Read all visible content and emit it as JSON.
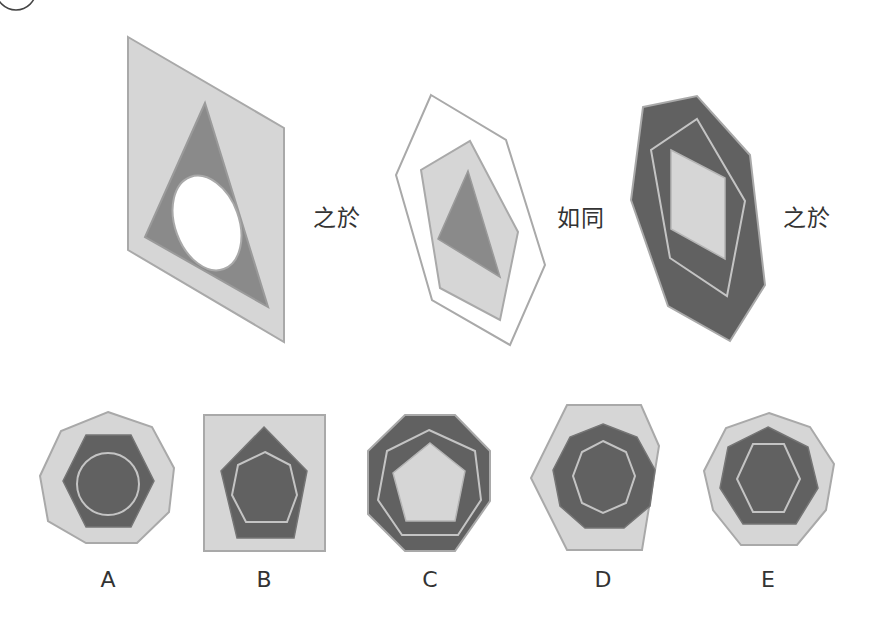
{
  "question": {
    "relations": [
      "之於",
      "如同",
      "之於"
    ],
    "options": [
      "A",
      "B",
      "C",
      "D",
      "E"
    ]
  },
  "colors": {
    "light": "#d6d6d6",
    "dark": "#616161",
    "mid": "#8a8a8a",
    "stroke": "#a9a9a9",
    "white": "#ffffff",
    "text": "#333333"
  },
  "figures": {
    "fig1": {
      "outer": "parallelogram",
      "middle": "triangle",
      "inner": "ellipse (white)"
    },
    "fig2": {
      "outer": "hexagon outline",
      "middle": "pentagon",
      "inner": "triangle"
    },
    "fig3": {
      "outer": "heptagon",
      "middle": "pentagon outline",
      "inner": "rhombus"
    },
    "A": {
      "outer": "nonagon",
      "middle": "hexagon",
      "inner": "circle outline"
    },
    "B": {
      "outer": "square",
      "middle": "pentagon",
      "inner": "heptagon outline"
    },
    "C": {
      "outer": "octagon",
      "middle": "heptagon outline",
      "inner": "pentagon"
    },
    "D": {
      "outer": "hexagon",
      "middle": "nonagon",
      "inner": "octagon outline"
    },
    "E": {
      "outer": "nonagon",
      "middle": "heptagon",
      "inner": "hexagon outline"
    }
  }
}
